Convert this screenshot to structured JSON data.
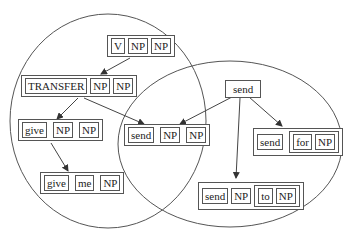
{
  "diagram": {
    "type": "construction-network",
    "regions": [
      {
        "id": "left-region",
        "shape": "ellipse",
        "cx": 108,
        "cy": 121,
        "rx": 98,
        "ry": 107
      },
      {
        "id": "right-region",
        "shape": "ellipse",
        "cx": 230,
        "cy": 144,
        "rx": 112,
        "ry": 83
      }
    ],
    "colors": {
      "stroke": "#555555",
      "text": "#222222",
      "background": "#ffffff"
    },
    "nodes": {
      "v_np_np": {
        "cells": [
          "V",
          "NP",
          "NP"
        ]
      },
      "transfer_np_np": {
        "cells": [
          "TRANSFER",
          "NP",
          "NP"
        ]
      },
      "give_np_np": {
        "cells": [
          "give",
          "NP",
          "NP"
        ]
      },
      "give_me_np": {
        "cells": [
          "give",
          "me",
          "NP"
        ]
      },
      "send_np_np": {
        "cells": [
          "send",
          "NP",
          "NP"
        ]
      },
      "send": {
        "label": "send"
      },
      "send_for_np": {
        "cells": [
          "send"
        ],
        "group": [
          "for",
          "NP"
        ]
      },
      "send_np_to_np": {
        "cells": [
          "send",
          "NP"
        ],
        "group": [
          "to",
          "NP"
        ]
      }
    },
    "edges": [
      {
        "from": "V NP NP",
        "to": "TRANSFER NP NP",
        "arrow": true
      },
      {
        "from": "TRANSFER NP NP",
        "to": "give NP NP",
        "arrow": true
      },
      {
        "from": "TRANSFER NP NP",
        "to": "send NP NP",
        "arrow": true
      },
      {
        "from": "give NP NP",
        "to": "give me NP",
        "arrow": true
      },
      {
        "from": "send",
        "to": "send NP NP",
        "arrow": true
      },
      {
        "from": "send",
        "to": "send NP to NP",
        "arrow": true
      },
      {
        "from": "send",
        "to": "send for NP",
        "arrow": true
      }
    ]
  }
}
